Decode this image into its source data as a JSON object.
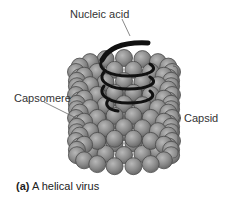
{
  "labels": {
    "nucleic_acid": "Nucleic acid",
    "capsomere": "Capsomere",
    "capsid": "Capsid"
  },
  "caption": {
    "part": "(a)",
    "text": " A helical virus"
  },
  "colors": {
    "capsomere_fill": "#8c8c8c",
    "capsomere_highlight": "#b5b5b5",
    "capsomere_outline": "#4a4a4a",
    "nucleic_acid": "#111111",
    "leader_line": "#555555"
  }
}
